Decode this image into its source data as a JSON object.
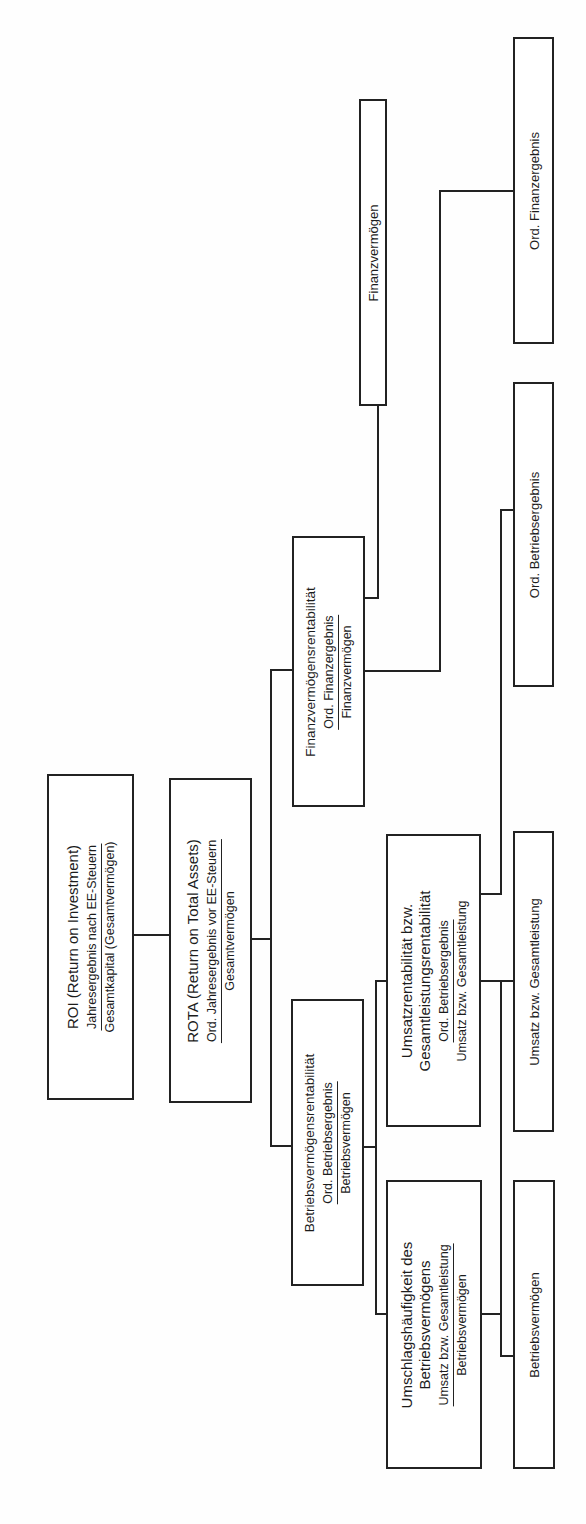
{
  "diagram": {
    "type": "ratio-tree",
    "orientation": "rotated-90-ccw",
    "nodes": {
      "roi": {
        "title": "ROI (Return on Investment)",
        "numerator": "Jahresergebnis nach EE-Steuern",
        "denominator": "Gesamtkapital (Gesamtvermögen)"
      },
      "rota": {
        "title": "ROTA (Return on Total Assets)",
        "numerator": "Ord. Jahresergebnis vor EE-Steuern",
        "denominator": "Gesamtvermögen"
      },
      "fvr": {
        "title": "Finanzvermögensrentabilität",
        "numerator": "Ord. Finanzergebnis",
        "denominator": "Finanzvermögen"
      },
      "bvr": {
        "title": "Betriebsvermögensrentabilität",
        "numerator": "Ord. Betriebsergebnis",
        "denominator": "Betriebsvermögen"
      },
      "umsatzrent": {
        "title_line1": "Umsatzrentabilität bzw.",
        "title_line2": "Gesamtleistungsrentabilität",
        "numerator": "Ord. Betriebsergebnis",
        "denominator": "Umsatz bzw. Gesamtleistung"
      },
      "umschlag": {
        "title_line1": "Umschlagshäufigkeit des",
        "title_line2": "Betriebsvermögens",
        "numerator": "Umsatz bzw. Gesamtleistung",
        "denominator": "Betriebsvermögen"
      },
      "finanzvermoegen": {
        "label": "Finanzvermögen"
      },
      "ord_finanzergebnis": {
        "label": "Ord. Finanzergebnis"
      },
      "ord_betriebsergebnis": {
        "label": "Ord. Betriebsergebnis"
      },
      "umsatz": {
        "label": "Umsatz bzw. Gesamtleistung"
      },
      "betriebsvermoegen": {
        "label": "Betriebsvermögen"
      }
    },
    "edges": [
      [
        "roi",
        "rota"
      ],
      [
        "rota",
        "fvr"
      ],
      [
        "rota",
        "bvr"
      ],
      [
        "fvr",
        "finanzvermoegen"
      ],
      [
        "fvr",
        "ord_finanzergebnis"
      ],
      [
        "bvr",
        "umsatzrent"
      ],
      [
        "bvr",
        "umschlag"
      ],
      [
        "umsatzrent",
        "ord_betriebsergebnis"
      ],
      [
        "umsatzrent",
        "umsatz"
      ],
      [
        "umschlag",
        "umsatz"
      ],
      [
        "umschlag",
        "betriebsvermoegen"
      ]
    ]
  }
}
